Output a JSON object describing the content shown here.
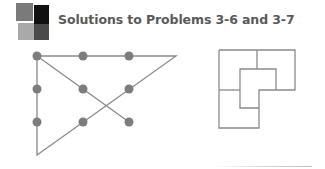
{
  "header": {
    "title": "Solutions to Problems 3-6 and 3-7",
    "logo_icon": "four-square-logo-icon"
  },
  "colors": {
    "title_text": "#5a5a5a",
    "line": "#8a8a8a",
    "dot": "#7d7d7d",
    "logo_top_left": "#7a7a7a",
    "logo_top_right": "#111111",
    "logo_bottom_left": "#a9a9a9",
    "logo_bottom_right": "#4a4a4a"
  },
  "problem_3_6": {
    "description": "Nine-dot puzzle solved with four connected straight lines",
    "grid": {
      "rows": 3,
      "cols": 3
    },
    "dots": [
      {
        "row": 0,
        "col": 0
      },
      {
        "row": 0,
        "col": 1
      },
      {
        "row": 0,
        "col": 2
      },
      {
        "row": 1,
        "col": 0
      },
      {
        "row": 1,
        "col": 1
      },
      {
        "row": 1,
        "col": 2
      },
      {
        "row": 2,
        "col": 0
      },
      {
        "row": 2,
        "col": 1
      },
      {
        "row": 2,
        "col": 2
      }
    ],
    "path_in_grid_units": [
      {
        "col": 0,
        "row": 0
      },
      {
        "col": 3,
        "row": 0
      },
      {
        "col": 0,
        "row": 3
      },
      {
        "col": 0,
        "row": 0
      },
      {
        "col": 2,
        "row": 2
      }
    ]
  },
  "problem_3_7": {
    "description": "L-shaped figure divided into four congruent smaller L-shapes"
  }
}
